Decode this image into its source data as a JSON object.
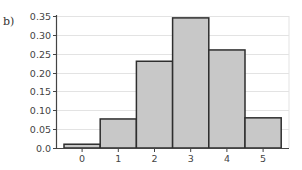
{
  "panel_label": "b)",
  "colors": {
    "bar_fill": "#c8c8c8",
    "bar_stroke": "#2e2e2e",
    "grid": "#e3e3e3",
    "axis": "#444444",
    "text": "#444444"
  },
  "chart_data": {
    "type": "bar",
    "title": "",
    "xlabel": "",
    "ylabel": "",
    "categories": [
      "0",
      "1",
      "2",
      "3",
      "4",
      "5"
    ],
    "values": [
      0.01,
      0.077,
      0.23,
      0.345,
      0.26,
      0.08
    ],
    "ylim": [
      0,
      0.35
    ],
    "yticks": [
      0.0,
      0.05,
      0.1,
      0.15,
      0.2,
      0.25,
      0.3,
      0.35
    ],
    "ytick_labels": [
      "0.0",
      "0.05",
      "0.10",
      "0.15",
      "0.20",
      "0.25",
      "0.30",
      "0.35"
    ],
    "grid": true,
    "legend": null,
    "bar_style": "histogram (adjacent bars, no gaps)"
  }
}
